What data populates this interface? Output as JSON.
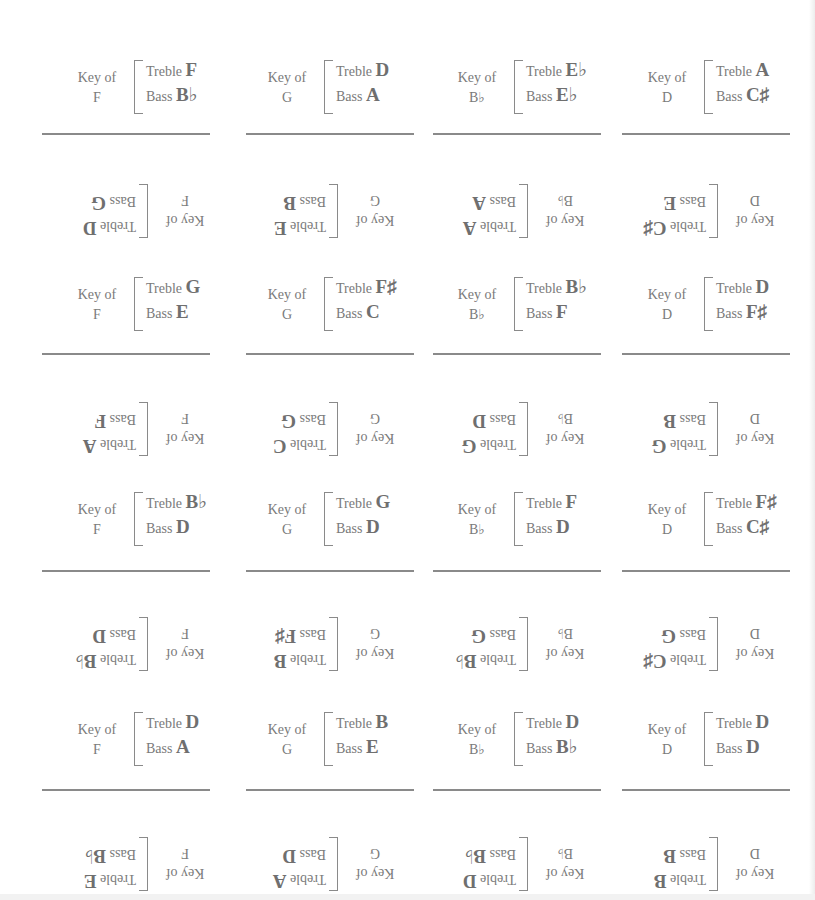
{
  "labels": {
    "key_of": "Key of",
    "treble": "Treble",
    "bass": "Bass"
  },
  "cards": [
    {
      "key": "F",
      "treble": "F",
      "bass": "B♭",
      "upside_down": false
    },
    {
      "key": "G",
      "treble": "D",
      "bass": "A",
      "upside_down": false
    },
    {
      "key": "B♭",
      "treble": "E♭",
      "bass": "E♭",
      "upside_down": false
    },
    {
      "key": "D",
      "treble": "A",
      "bass": "C♯",
      "upside_down": false
    },
    {
      "key": "F",
      "treble": "D",
      "bass": "G",
      "upside_down": true
    },
    {
      "key": "G",
      "treble": "E",
      "bass": "B",
      "upside_down": true
    },
    {
      "key": "B♭",
      "treble": "A",
      "bass": "A",
      "upside_down": true
    },
    {
      "key": "D",
      "treble": "C♯",
      "bass": "E",
      "upside_down": true
    },
    {
      "key": "F",
      "treble": "G",
      "bass": "E",
      "upside_down": false
    },
    {
      "key": "G",
      "treble": "F♯",
      "bass": "C",
      "upside_down": false
    },
    {
      "key": "B♭",
      "treble": "B♭",
      "bass": "F",
      "upside_down": false
    },
    {
      "key": "D",
      "treble": "D",
      "bass": "F♯",
      "upside_down": false
    },
    {
      "key": "F",
      "treble": "A",
      "bass": "F",
      "upside_down": true
    },
    {
      "key": "G",
      "treble": "C",
      "bass": "G",
      "upside_down": true
    },
    {
      "key": "B♭",
      "treble": "G",
      "bass": "D",
      "upside_down": true
    },
    {
      "key": "D",
      "treble": "G",
      "bass": "B",
      "upside_down": true
    },
    {
      "key": "F",
      "treble": "B♭",
      "bass": "D",
      "upside_down": false
    },
    {
      "key": "G",
      "treble": "G",
      "bass": "D",
      "upside_down": false
    },
    {
      "key": "B♭",
      "treble": "F",
      "bass": "D",
      "upside_down": false
    },
    {
      "key": "D",
      "treble": "F♯",
      "bass": "C♯",
      "upside_down": false
    },
    {
      "key": "F",
      "treble": "B♭",
      "bass": "D",
      "upside_down": true
    },
    {
      "key": "G",
      "treble": "B",
      "bass": "F♯",
      "upside_down": true
    },
    {
      "key": "B♭",
      "treble": "B♭",
      "bass": "G",
      "upside_down": true
    },
    {
      "key": "D",
      "treble": "C♯",
      "bass": "G",
      "upside_down": true
    },
    {
      "key": "F",
      "treble": "D",
      "bass": "A",
      "upside_down": false
    },
    {
      "key": "G",
      "treble": "B",
      "bass": "E",
      "upside_down": false
    },
    {
      "key": "B♭",
      "treble": "D",
      "bass": "B♭",
      "upside_down": false
    },
    {
      "key": "D",
      "treble": "D",
      "bass": "D",
      "upside_down": false
    },
    {
      "key": "F",
      "treble": "E",
      "bass": "B♭",
      "upside_down": true
    },
    {
      "key": "G",
      "treble": "A",
      "bass": "D",
      "upside_down": true
    },
    {
      "key": "B♭",
      "treble": "D",
      "bass": "B♭",
      "upside_down": true
    },
    {
      "key": "D",
      "treble": "B",
      "bass": "B",
      "upside_down": true
    }
  ]
}
